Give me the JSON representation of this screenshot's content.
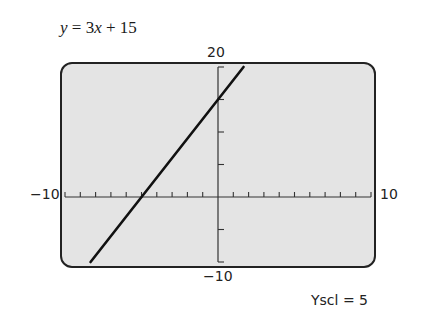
{
  "equation": {
    "y": "y",
    "eq": " = 3",
    "x": "x",
    "rest": " + 15"
  },
  "labels": {
    "ymax": "20",
    "ymin": "−10",
    "xmin": "−10",
    "xmax": "10",
    "yscl": "Yscl = 5"
  },
  "chart_data": {
    "type": "line",
    "title": "y = 3x + 15",
    "xlabel": "",
    "ylabel": "",
    "xlim": [
      -10,
      10
    ],
    "ylim": [
      -10,
      20
    ],
    "xscl": 1,
    "yscl": 5,
    "grid": false,
    "series": [
      {
        "name": "y = 3x + 15",
        "x": [
          -8.33,
          1.67
        ],
        "y": [
          -10,
          20
        ]
      }
    ],
    "annotations": [
      "Yscl = 5"
    ]
  },
  "colors": {
    "screen_bg": "#e4e4e4",
    "line": "#111111",
    "frame": "#222222"
  }
}
